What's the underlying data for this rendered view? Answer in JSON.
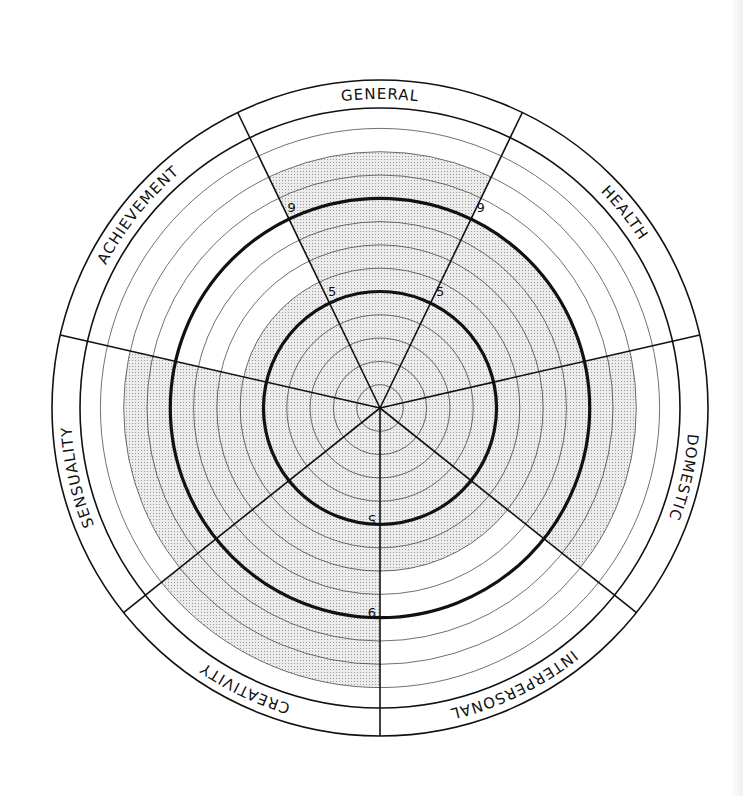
{
  "chart_data": {
    "type": "radial-sector",
    "title": "",
    "center": [
      380,
      408
    ],
    "ring_count": 12,
    "ring_spacing_px": 23.3,
    "label_band": {
      "inner_radius": 300,
      "outer_radius": 328
    },
    "emphasized_rings": [
      5,
      9
    ],
    "scale_labels": [
      "5",
      "9"
    ],
    "start_angle_deg": 270,
    "sector_angle_deg": 51.4286,
    "shading_color": "#d9d9d9",
    "line_color": "#111111",
    "categories": [
      "INTERPERSONAL",
      "DOMESTIC",
      "HEALTH",
      "GENERAL",
      "ACHIEVEMENT",
      "SENSUALITY",
      "CREATIVITY"
    ],
    "values": [
      7,
      11,
      9,
      11,
      6,
      11,
      12
    ],
    "range": [
      0,
      12
    ]
  }
}
